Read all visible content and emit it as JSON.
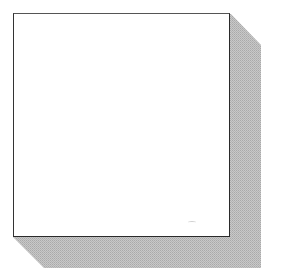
{
  "figure": {
    "colors": {
      "box_fill": "#ffffff",
      "box_border": "#2a2a2a",
      "shadow": "#bdbdbd",
      "background": "#ffffff"
    }
  }
}
